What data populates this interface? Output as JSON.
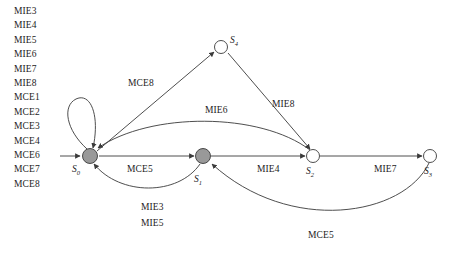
{
  "figure": {
    "type": "state-transition-diagram",
    "background_color": "#ffffff",
    "stroke_color": "#3a3a3a",
    "text_color": "#1c1c1c",
    "filled_node_color": "#999999",
    "hollow_node_color": "#ffffff"
  },
  "event_list": {
    "items": [
      {
        "label": "MIE3"
      },
      {
        "label": "MIE4"
      },
      {
        "label": "MIE5"
      },
      {
        "label": "MIE6"
      },
      {
        "label": "MIE7"
      },
      {
        "label": "MIE8"
      },
      {
        "label": "MCE1"
      },
      {
        "label": "MCE2"
      },
      {
        "label": "MCE3"
      },
      {
        "label": "MCE4"
      },
      {
        "label": "MCE6"
      },
      {
        "label": "MCE7"
      },
      {
        "label": "MCE8"
      }
    ]
  },
  "nodes": [
    {
      "id": "S0",
      "name": "S",
      "sub": "0",
      "x": 90,
      "y": 156,
      "r": 7.5,
      "style": "filled",
      "label_x": 72,
      "label_y": 164
    },
    {
      "id": "S1",
      "name": "S",
      "sub": "1",
      "x": 203,
      "y": 156,
      "r": 7.5,
      "style": "filled",
      "label_x": 194,
      "label_y": 174
    },
    {
      "id": "S2",
      "name": "S",
      "sub": "2",
      "x": 313,
      "y": 156,
      "r": 6.5,
      "style": "hollow",
      "label_x": 306,
      "label_y": 166
    },
    {
      "id": "S3",
      "name": "S",
      "sub": "3",
      "x": 430,
      "y": 156,
      "r": 6.5,
      "style": "hollow",
      "label_x": 424,
      "label_y": 166
    },
    {
      "id": "S4",
      "name": "S",
      "sub": "4",
      "x": 221,
      "y": 47,
      "r": 6.5,
      "style": "hollow",
      "label_x": 230,
      "label_y": 42
    }
  ],
  "edge_labels": [
    {
      "id": "mce8",
      "text": "MCE8",
      "x": 128,
      "y": 78
    },
    {
      "id": "mie8",
      "text": "MIE8",
      "x": 272,
      "y": 99
    },
    {
      "id": "mie6",
      "text": "MIE6",
      "x": 205,
      "y": 105
    },
    {
      "id": "mce5_lower_left",
      "text": "MCE5",
      "x": 127,
      "y": 164
    },
    {
      "id": "mie4",
      "text": "MIE4",
      "x": 257,
      "y": 164
    },
    {
      "id": "mie7",
      "text": "MIE7",
      "x": 374,
      "y": 164
    },
    {
      "id": "mie3",
      "text": "MIE3",
      "x": 141,
      "y": 207
    },
    {
      "id": "mie5",
      "text": "MIE5",
      "x": 141,
      "y": 223
    },
    {
      "id": "mce5_bottom_right",
      "text": "MCE5",
      "x": 308,
      "y": 232
    }
  ],
  "transitions": [
    {
      "from": "external",
      "to": "S0",
      "event": ""
    },
    {
      "from": "S0",
      "to": "S0",
      "event": "",
      "kind": "self-loop"
    },
    {
      "from": "S0",
      "to": "S4",
      "event": "MCE8"
    },
    {
      "from": "S4",
      "to": "S2",
      "event": "MIE8"
    },
    {
      "from": "S2",
      "to": "S0",
      "event": "MIE6"
    },
    {
      "from": "S0",
      "to": "S1",
      "event": "MCE5"
    },
    {
      "from": "S1",
      "to": "S0",
      "event": "MIE3 / MIE5"
    },
    {
      "from": "S1",
      "to": "S2",
      "event": "MIE4"
    },
    {
      "from": "S2",
      "to": "S3",
      "event": "MIE7"
    },
    {
      "from": "S3",
      "to": "S1",
      "event": "MCE5"
    }
  ]
}
